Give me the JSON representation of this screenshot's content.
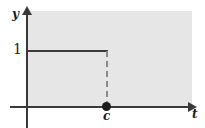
{
  "figure": {
    "type": "step-function-plot",
    "axes": {
      "y_axis_label": "y",
      "x_axis_label": "t"
    },
    "tick_labels": {
      "y_one": "1",
      "x_c": "c"
    },
    "colors": {
      "panel_background": "#e6e6e6",
      "axis": "#3a3a3a",
      "curve": "#3a3a3a",
      "dashed": "#8a8a8a",
      "point": "#1c1c1c",
      "page_background": "#ffffff"
    }
  },
  "chart_data": {
    "type": "line",
    "title": "",
    "subtitle": "",
    "xlabel": "t",
    "ylabel": "y",
    "xlim": [
      0,
      2.1
    ],
    "ylim": [
      0,
      1.2
    ],
    "grid": false,
    "legend": null,
    "xticks": [
      {
        "value": 1.0,
        "label": "c"
      }
    ],
    "yticks": [
      {
        "value": 1.0,
        "label": "1"
      }
    ],
    "series": [
      {
        "name": "step",
        "style": "solid",
        "x": [
          0,
          1.0
        ],
        "values": [
          1,
          1
        ]
      },
      {
        "name": "drop",
        "style": "dashed",
        "x": [
          1.0,
          1.0
        ],
        "values": [
          1,
          0
        ]
      }
    ],
    "points": [
      {
        "x": 1.0,
        "y": 0,
        "marker": "filled-circle",
        "label": "c"
      }
    ],
    "annotations": [
      {
        "text": "1",
        "x": 0,
        "y": 1.0,
        "position": "left-of-y-axis"
      },
      {
        "text": "c",
        "x": 1.0,
        "y": 0,
        "position": "below-x-axis"
      },
      {
        "text": "y",
        "position": "top-of-y-axis"
      },
      {
        "text": "t",
        "position": "right-of-x-axis"
      }
    ]
  }
}
